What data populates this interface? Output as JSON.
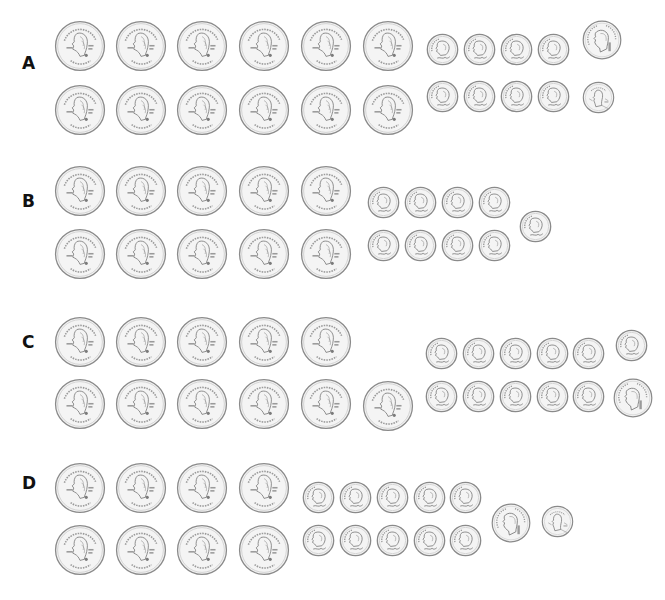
{
  "question_fragment": "",
  "options": [
    {
      "label": "A",
      "label_pos": [
        22,
        55
      ],
      "counts": {
        "quarters": 12,
        "dimes": 8,
        "nickels": 1,
        "pennies": 1
      },
      "coins": [
        {
          "type": "quarter",
          "cx": 80,
          "cy": 46
        },
        {
          "type": "quarter",
          "cx": 141,
          "cy": 46
        },
        {
          "type": "quarter",
          "cx": 202,
          "cy": 46
        },
        {
          "type": "quarter",
          "cx": 264,
          "cy": 46
        },
        {
          "type": "quarter",
          "cx": 326,
          "cy": 46
        },
        {
          "type": "quarter",
          "cx": 388,
          "cy": 46
        },
        {
          "type": "quarter",
          "cx": 80,
          "cy": 110
        },
        {
          "type": "quarter",
          "cx": 141,
          "cy": 110
        },
        {
          "type": "quarter",
          "cx": 202,
          "cy": 110
        },
        {
          "type": "quarter",
          "cx": 264,
          "cy": 110
        },
        {
          "type": "quarter",
          "cx": 326,
          "cy": 110
        },
        {
          "type": "quarter",
          "cx": 388,
          "cy": 110
        },
        {
          "type": "dime",
          "cx": 442,
          "cy": 49
        },
        {
          "type": "dime",
          "cx": 479,
          "cy": 49
        },
        {
          "type": "dime",
          "cx": 516,
          "cy": 49
        },
        {
          "type": "dime",
          "cx": 553,
          "cy": 49
        },
        {
          "type": "dime",
          "cx": 442,
          "cy": 96
        },
        {
          "type": "dime",
          "cx": 479,
          "cy": 96
        },
        {
          "type": "dime",
          "cx": 516,
          "cy": 96
        },
        {
          "type": "dime",
          "cx": 553,
          "cy": 96
        },
        {
          "type": "nickel",
          "cx": 602,
          "cy": 40
        },
        {
          "type": "penny",
          "cx": 598,
          "cy": 97
        }
      ]
    },
    {
      "label": "B",
      "label_pos": [
        22,
        193
      ],
      "counts": {
        "quarters": 10,
        "dimes": 9,
        "nickels": 0,
        "pennies": 0
      },
      "coins": [
        {
          "type": "quarter",
          "cx": 80,
          "cy": 191
        },
        {
          "type": "quarter",
          "cx": 141,
          "cy": 191
        },
        {
          "type": "quarter",
          "cx": 202,
          "cy": 191
        },
        {
          "type": "quarter",
          "cx": 264,
          "cy": 191
        },
        {
          "type": "quarter",
          "cx": 326,
          "cy": 191
        },
        {
          "type": "quarter",
          "cx": 80,
          "cy": 254
        },
        {
          "type": "quarter",
          "cx": 141,
          "cy": 254
        },
        {
          "type": "quarter",
          "cx": 202,
          "cy": 254
        },
        {
          "type": "quarter",
          "cx": 264,
          "cy": 254
        },
        {
          "type": "quarter",
          "cx": 326,
          "cy": 254
        },
        {
          "type": "dime",
          "cx": 383,
          "cy": 202
        },
        {
          "type": "dime",
          "cx": 420,
          "cy": 202
        },
        {
          "type": "dime",
          "cx": 457,
          "cy": 202
        },
        {
          "type": "dime",
          "cx": 494,
          "cy": 202
        },
        {
          "type": "dime",
          "cx": 383,
          "cy": 245
        },
        {
          "type": "dime",
          "cx": 420,
          "cy": 245
        },
        {
          "type": "dime",
          "cx": 457,
          "cy": 245
        },
        {
          "type": "dime",
          "cx": 494,
          "cy": 245
        },
        {
          "type": "dime",
          "cx": 535,
          "cy": 226
        }
      ]
    },
    {
      "label": "C",
      "label_pos": [
        22,
        334
      ],
      "counts": {
        "quarters": 11,
        "dimes": 11,
        "nickels": 1,
        "pennies": 0
      },
      "coins": [
        {
          "type": "quarter",
          "cx": 80,
          "cy": 342
        },
        {
          "type": "quarter",
          "cx": 141,
          "cy": 342
        },
        {
          "type": "quarter",
          "cx": 202,
          "cy": 342
        },
        {
          "type": "quarter",
          "cx": 264,
          "cy": 342
        },
        {
          "type": "quarter",
          "cx": 326,
          "cy": 342
        },
        {
          "type": "quarter",
          "cx": 80,
          "cy": 404
        },
        {
          "type": "quarter",
          "cx": 141,
          "cy": 404
        },
        {
          "type": "quarter",
          "cx": 202,
          "cy": 404
        },
        {
          "type": "quarter",
          "cx": 264,
          "cy": 404
        },
        {
          "type": "quarter",
          "cx": 326,
          "cy": 404
        },
        {
          "type": "quarter",
          "cx": 388,
          "cy": 406
        },
        {
          "type": "dime",
          "cx": 441,
          "cy": 353
        },
        {
          "type": "dime",
          "cx": 478,
          "cy": 353
        },
        {
          "type": "dime",
          "cx": 515,
          "cy": 353
        },
        {
          "type": "dime",
          "cx": 552,
          "cy": 353
        },
        {
          "type": "dime",
          "cx": 588,
          "cy": 353
        },
        {
          "type": "dime",
          "cx": 441,
          "cy": 396
        },
        {
          "type": "dime",
          "cx": 478,
          "cy": 396
        },
        {
          "type": "dime",
          "cx": 515,
          "cy": 396
        },
        {
          "type": "dime",
          "cx": 552,
          "cy": 396
        },
        {
          "type": "dime",
          "cx": 588,
          "cy": 396
        },
        {
          "type": "dime",
          "cx": 631,
          "cy": 345
        },
        {
          "type": "nickel",
          "cx": 633,
          "cy": 398
        }
      ]
    },
    {
      "label": "D",
      "label_pos": [
        22,
        475
      ],
      "counts": {
        "quarters": 8,
        "dimes": 10,
        "nickels": 1,
        "pennies": 1
      },
      "coins": [
        {
          "type": "quarter",
          "cx": 80,
          "cy": 488
        },
        {
          "type": "quarter",
          "cx": 141,
          "cy": 488
        },
        {
          "type": "quarter",
          "cx": 202,
          "cy": 488
        },
        {
          "type": "quarter",
          "cx": 264,
          "cy": 488
        },
        {
          "type": "quarter",
          "cx": 80,
          "cy": 550
        },
        {
          "type": "quarter",
          "cx": 141,
          "cy": 550
        },
        {
          "type": "quarter",
          "cx": 202,
          "cy": 550
        },
        {
          "type": "quarter",
          "cx": 264,
          "cy": 550
        },
        {
          "type": "dime",
          "cx": 318,
          "cy": 497
        },
        {
          "type": "dime",
          "cx": 355,
          "cy": 497
        },
        {
          "type": "dime",
          "cx": 392,
          "cy": 497
        },
        {
          "type": "dime",
          "cx": 429,
          "cy": 497
        },
        {
          "type": "dime",
          "cx": 465,
          "cy": 497
        },
        {
          "type": "dime",
          "cx": 318,
          "cy": 540
        },
        {
          "type": "dime",
          "cx": 355,
          "cy": 540
        },
        {
          "type": "dime",
          "cx": 392,
          "cy": 540
        },
        {
          "type": "dime",
          "cx": 429,
          "cy": 540
        },
        {
          "type": "dime",
          "cx": 465,
          "cy": 540
        },
        {
          "type": "nickel",
          "cx": 511,
          "cy": 523
        },
        {
          "type": "penny",
          "cx": 557,
          "cy": 521
        }
      ]
    }
  ],
  "coin_specs": {
    "quarter": {
      "diameter": 52,
      "value_cents": 25,
      "icon": "quarter-coin-icon"
    },
    "dime": {
      "diameter": 33,
      "value_cents": 10,
      "icon": "dime-coin-icon"
    },
    "nickel": {
      "diameter": 40,
      "value_cents": 5,
      "icon": "nickel-coin-icon"
    },
    "penny": {
      "diameter": 33,
      "value_cents": 1,
      "icon": "penny-coin-icon"
    }
  },
  "colors": {
    "coin_fill": "#f4f4f4",
    "coin_rim": "#8a8a8a",
    "coin_detail": "#9a9a9a",
    "label": "#111111",
    "background": "#ffffff"
  }
}
